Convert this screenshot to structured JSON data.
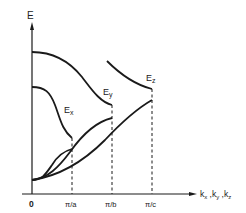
{
  "diagram": {
    "y_axis_label": "E",
    "x_axis_label": "kx ,ky ,kz",
    "x_axis_label_parts": [
      {
        "base": "k",
        "sub": "x"
      },
      {
        "base": "k",
        "sub": "y"
      },
      {
        "base": "k",
        "sub": "z"
      }
    ],
    "tick_labels": [
      "0",
      "π/a",
      "π/b",
      "π/c"
    ],
    "curve_labels": [
      {
        "base": "E",
        "sub": "x"
      },
      {
        "base": "E",
        "sub": "y"
      },
      {
        "base": "E",
        "sub": "z"
      }
    ],
    "line_color": "#1a1a1a"
  }
}
